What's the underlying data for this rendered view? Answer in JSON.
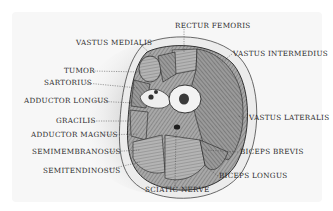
{
  "diagram": {
    "colors": {
      "background": "#ffffff",
      "paper": "#f6f6f6",
      "skin_ring": "#e6e6e6",
      "muscle": "#9a9a9a",
      "muscle_dark": "#5a5a5a",
      "bone": "#f2f2f2",
      "marrow": "#3a3a3a",
      "text": "#2a2a2a",
      "shadow": "#c8c8c8"
    },
    "labels": [
      {
        "id": "rectur-femoris",
        "text": "RECTUR FEMORIS",
        "x": 175,
        "y": 25
      },
      {
        "id": "vastus-medialis",
        "text": "VASTUS MEDIALIS",
        "x": 76,
        "y": 42
      },
      {
        "id": "vastus-intermedius",
        "text": "VASTUS INTERMEDIUS",
        "x": 233,
        "y": 51
      },
      {
        "id": "tumor",
        "text": "TUMOR",
        "x": 64,
        "y": 68
      },
      {
        "id": "sartorius",
        "text": "SARTORIUS",
        "x": 44,
        "y": 79
      },
      {
        "id": "adductor-longus",
        "text": "ADDUCTOR LONGUS",
        "x": 24,
        "y": 97
      },
      {
        "id": "vastus-lateralis",
        "text": "VASTUS LATERALIS",
        "x": 249,
        "y": 115
      },
      {
        "id": "gracilis",
        "text": "GRACILIS",
        "x": 56,
        "y": 117
      },
      {
        "id": "adductor-magnus",
        "text": "ADDUCTOR MAGNUS",
        "x": 31,
        "y": 131
      },
      {
        "id": "biceps-brevis",
        "text": "BICEPS BREVIS",
        "x": 240,
        "y": 149
      },
      {
        "id": "semimembranosus",
        "text": "SEMIMEMBRANOSUS",
        "x": 32,
        "y": 148
      },
      {
        "id": "biceps-longus",
        "text": "BICEPS LONGUS",
        "x": 219,
        "y": 173
      },
      {
        "id": "semitendinosus",
        "text": "SEMITENDINOSUS",
        "x": 43,
        "y": 168
      },
      {
        "id": "sciatic-nerve",
        "text": "SCIATIC NERVE",
        "x": 145,
        "y": 187
      }
    ]
  }
}
